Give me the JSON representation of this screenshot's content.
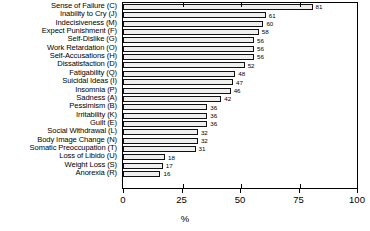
{
  "chart": {
    "xlabel": "%",
    "tick_labels": [
      "0",
      "25",
      "50",
      "75",
      "100"
    ]
  },
  "chart_data": {
    "type": "bar",
    "orientation": "horizontal",
    "title": "",
    "xlabel": "%",
    "ylabel": "",
    "xlim": [
      0,
      100
    ],
    "xticks": [
      0,
      25,
      50,
      75,
      100
    ],
    "grid": false,
    "legend": null,
    "bar_value_labels": true,
    "categories": [
      "Sense of Failure (C)",
      "Inability to Cry (J)",
      "Indecisiveness (M)",
      "Expect Punishment (F)",
      "Self-Dislike (G)",
      "Work Retardation (O)",
      "Self-Accusations (H)",
      "Dissatisfaction (D)",
      "Fatigability (Q)",
      "Suicidal Ideas (I)",
      "Insomnia (P)",
      "Sadness (A)",
      "Pessimism (B)",
      "Irritability (K)",
      "Guilt (E)",
      "Social Withdrawal (L)",
      "Body Image Change (N)",
      "Somatic Preoccupation (T)",
      "Loss of Libido (U)",
      "Weight Loss (S)",
      "Anorexia (R)"
    ],
    "values": [
      81,
      61,
      60,
      58,
      56,
      56,
      56,
      52,
      48,
      47,
      46,
      42,
      36,
      36,
      36,
      32,
      32,
      31,
      18,
      17,
      16
    ]
  }
}
